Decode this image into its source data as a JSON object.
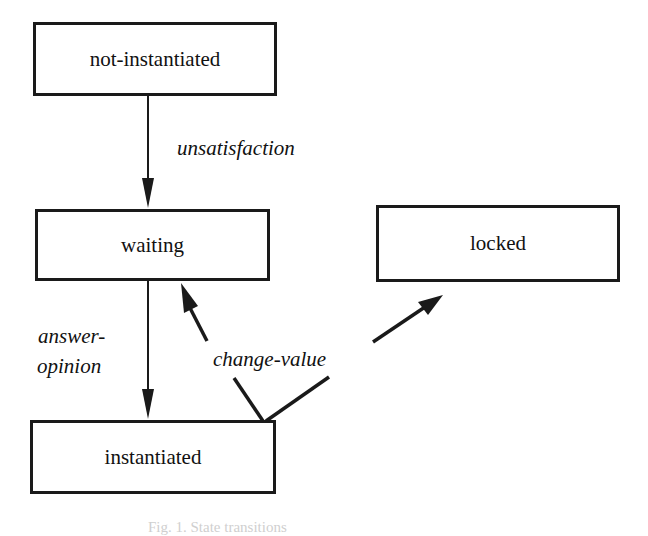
{
  "diagram": {
    "type": "state-transition",
    "states": [
      {
        "id": "not-instantiated",
        "label": "not-instantiated"
      },
      {
        "id": "waiting",
        "label": "waiting"
      },
      {
        "id": "locked",
        "label": "locked"
      },
      {
        "id": "instantiated",
        "label": "instantiated"
      }
    ],
    "transitions": [
      {
        "from": "not-instantiated",
        "to": "waiting",
        "label": "unsatisfaction"
      },
      {
        "from": "waiting",
        "to": "instantiated",
        "label_line1": "answer-",
        "label_line2": "opinion"
      },
      {
        "from": "instantiated",
        "to": "waiting",
        "label": "change-value"
      },
      {
        "from": "instantiated",
        "to": "locked",
        "label": "change-value"
      }
    ],
    "caption": "Fig. 1. State transitions"
  },
  "colors": {
    "stroke": "#1a1a1a",
    "background": "#ffffff"
  }
}
